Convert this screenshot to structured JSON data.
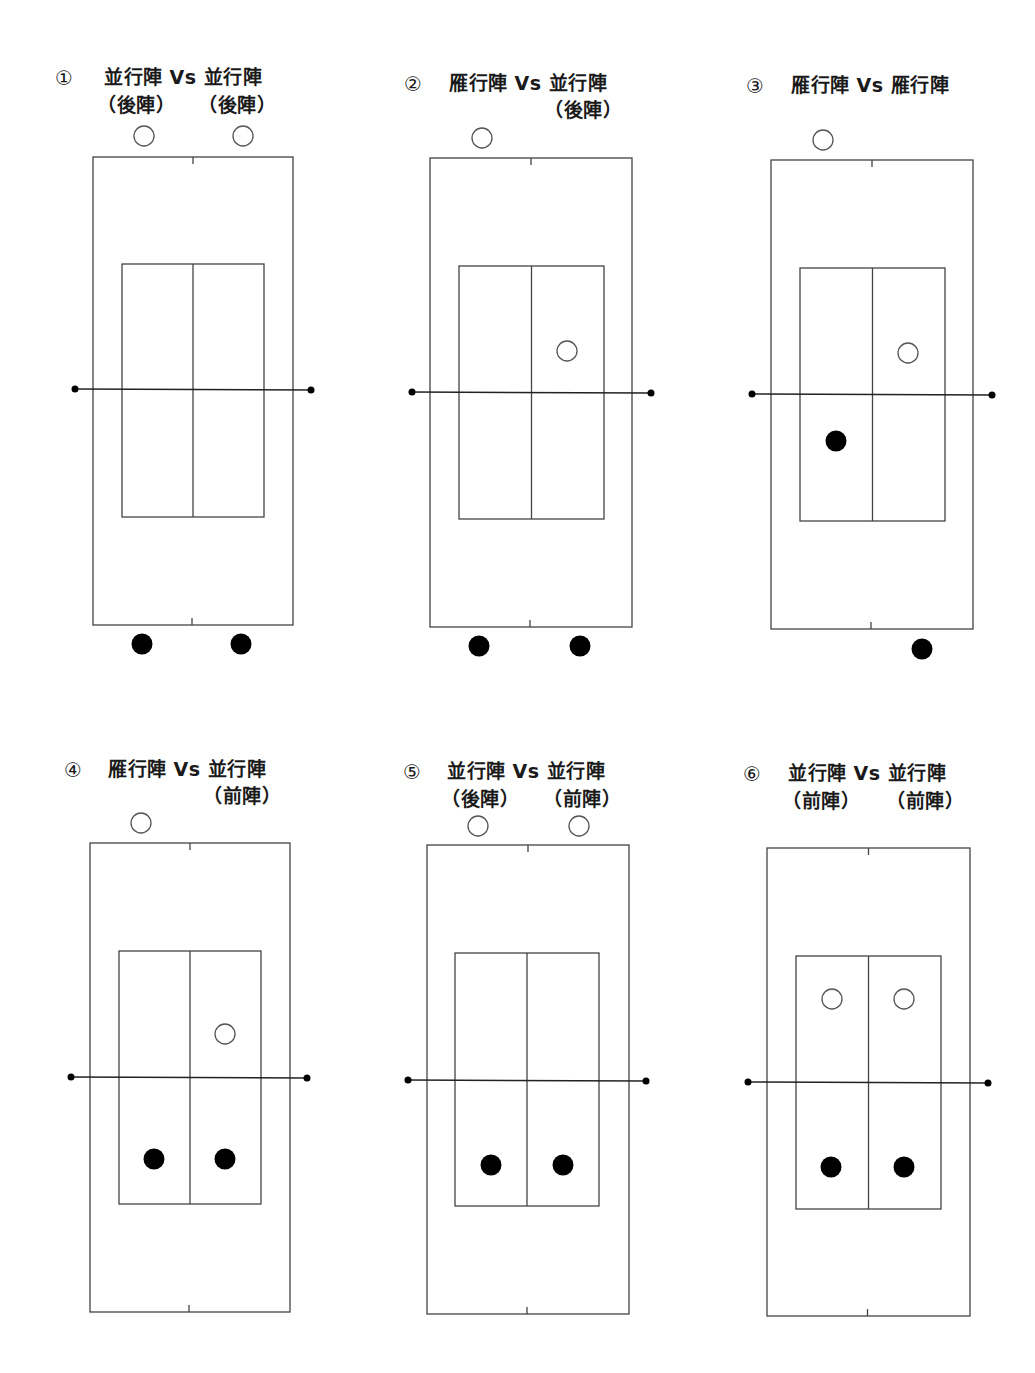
{
  "page": {
    "width": 1035,
    "height": 1373,
    "background": "#ffffff",
    "line_color": "#444444",
    "fill_color": "#000000"
  },
  "legend_semantics": {
    "hollow": "opposing pair (top side)",
    "filled": "own pair (bottom side)"
  },
  "panels": [
    {
      "id": 1,
      "number": "①",
      "title_line1": "並行陣 Vs 並行陣",
      "title_line2_left": "（後陣）",
      "title_line2_right": "（後陣）",
      "numPos": [
        55,
        66
      ],
      "t1Pos": [
        104,
        64
      ],
      "t2lPos": [
        97,
        92
      ],
      "t2rPos": [
        198,
        92
      ],
      "outer": [
        93,
        157,
        200,
        468
      ],
      "inner": [
        122,
        264,
        142,
        253
      ],
      "net": {
        "y": 389,
        "x1": 75,
        "x2": 311
      },
      "hollow": [
        [
          144,
          136
        ],
        [
          243,
          136
        ]
      ],
      "filled": [
        [
          142,
          644
        ],
        [
          241,
          644
        ]
      ]
    },
    {
      "id": 2,
      "number": "②",
      "title_line1": "雁行陣 Vs 並行陣",
      "title_line2_left": "",
      "title_line2_right": "（後陣）",
      "numPos": [
        404,
        72
      ],
      "t1Pos": [
        449,
        70
      ],
      "t2lPos": [
        0,
        0
      ],
      "t2rPos": [
        544,
        97
      ],
      "outer": [
        430,
        158,
        202,
        469
      ],
      "inner": [
        459,
        266,
        145,
        253
      ],
      "net": {
        "y": 392,
        "x1": 412,
        "x2": 651
      },
      "hollow": [
        [
          482,
          138
        ],
        [
          567,
          351
        ]
      ],
      "filled": [
        [
          479,
          646
        ],
        [
          580,
          646
        ]
      ]
    },
    {
      "id": 3,
      "number": "③",
      "title_line1": "雁行陣 Vs 雁行陣",
      "title_line2_left": "",
      "title_line2_right": "",
      "numPos": [
        746,
        74
      ],
      "t1Pos": [
        791,
        72
      ],
      "t2lPos": [
        0,
        0
      ],
      "t2rPos": [
        0,
        0
      ],
      "outer": [
        771,
        160,
        202,
        469
      ],
      "inner": [
        800,
        268,
        145,
        253
      ],
      "net": {
        "y": 394,
        "x1": 752,
        "x2": 992
      },
      "hollow": [
        [
          823,
          140
        ],
        [
          908,
          353
        ]
      ],
      "filled": [
        [
          836,
          441
        ],
        [
          922,
          649
        ]
      ]
    },
    {
      "id": 4,
      "number": "④",
      "title_line1": "雁行陣 Vs 並行陣",
      "title_line2_left": "",
      "title_line2_right": "（前陣）",
      "numPos": [
        64,
        758
      ],
      "t1Pos": [
        108,
        756
      ],
      "t2lPos": [
        0,
        0
      ],
      "t2rPos": [
        203,
        783
      ],
      "outer": [
        90,
        843,
        200,
        469
      ],
      "inner": [
        119,
        951,
        142,
        253
      ],
      "net": {
        "y": 1077,
        "x1": 71,
        "x2": 307
      },
      "hollow": [
        [
          141,
          823
        ],
        [
          225,
          1034
        ]
      ],
      "filled": [
        [
          154,
          1159
        ],
        [
          225,
          1159
        ]
      ]
    },
    {
      "id": 5,
      "number": "⑤",
      "title_line1": "並行陣 Vs 並行陣",
      "title_line2_left": "（後陣）",
      "title_line2_right": "（前陣）",
      "numPos": [
        403,
        760
      ],
      "t1Pos": [
        447,
        758
      ],
      "t2lPos": [
        441,
        786
      ],
      "t2rPos": [
        543,
        786
      ],
      "outer": [
        427,
        845,
        202,
        469
      ],
      "inner": [
        455,
        953,
        144,
        253
      ],
      "net": {
        "y": 1080,
        "x1": 408,
        "x2": 646
      },
      "hollow": [
        [
          478,
          826
        ],
        [
          579,
          826
        ]
      ],
      "filled": [
        [
          491,
          1165
        ],
        [
          563,
          1165
        ]
      ]
    },
    {
      "id": 6,
      "number": "⑥",
      "title_line1": "並行陣 Vs 並行陣",
      "title_line2_left": "（前陣）",
      "title_line2_right": "（前陣）",
      "numPos": [
        743,
        762
      ],
      "t1Pos": [
        788,
        760
      ],
      "t2lPos": [
        782,
        788
      ],
      "t2rPos": [
        886,
        788
      ],
      "outer": [
        767,
        848,
        203,
        468
      ],
      "inner": [
        796,
        956,
        145,
        253
      ],
      "net": {
        "y": 1082,
        "x1": 748,
        "x2": 988
      },
      "hollow": [
        [
          832,
          999
        ],
        [
          904,
          999
        ]
      ],
      "filled": [
        [
          831,
          1167
        ],
        [
          904,
          1167
        ]
      ]
    }
  ]
}
